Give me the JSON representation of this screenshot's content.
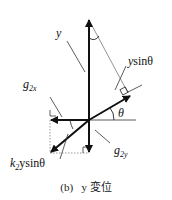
{
  "labels": {
    "y": "y",
    "y_sin_theta": {
      "main": "y",
      "rest": "sinθ"
    },
    "theta": "θ",
    "g2x": {
      "g": "g",
      "sub": "2x"
    },
    "g2y": {
      "g": "g",
      "sub": "2y"
    },
    "k2_y_sin_theta": {
      "k": "k",
      "sub": "2",
      "rest": "ysinθ"
    }
  },
  "caption": {
    "tag": "(b)",
    "text": "y 変位"
  },
  "colors": {
    "line": "#111111",
    "thin": "#555555",
    "dotted": "#888888"
  }
}
